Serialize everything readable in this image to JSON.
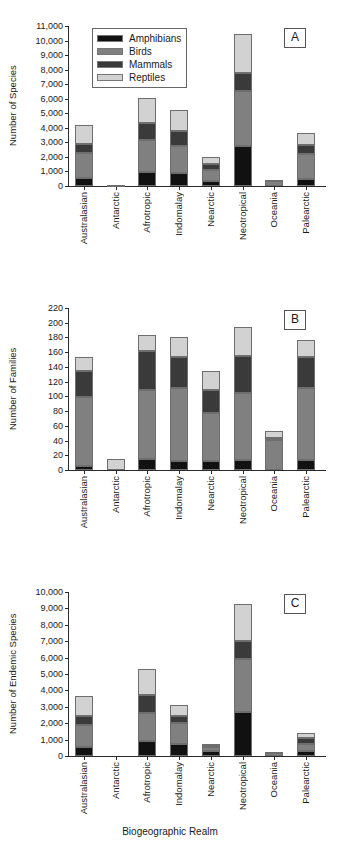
{
  "figure": {
    "xlabel": "Biogeographic Realm",
    "realms": [
      "Australasian",
      "Antarctic",
      "Afrotropic",
      "Indomalay",
      "Nearctic",
      "Neotropical",
      "Oceania",
      "Palearctic"
    ],
    "legend": {
      "position": "upper-left-panel-a",
      "entries": [
        {
          "label": "Amphibians",
          "color": "#111111"
        },
        {
          "label": "Birds",
          "color": "#808080"
        },
        {
          "label": "Mammals",
          "color": "#3a3a3a"
        },
        {
          "label": "Reptiles",
          "color": "#d2d2d2"
        }
      ]
    }
  },
  "chart_data": [
    {
      "id": "A",
      "type": "bar",
      "stacked": true,
      "panel_label": "A",
      "title": "",
      "xlabel": "",
      "ylabel": "Number of Species",
      "ylim": [
        0,
        11000
      ],
      "ytick_step": 1000,
      "yticks": [
        0,
        1000,
        2000,
        3000,
        4000,
        5000,
        6000,
        7000,
        8000,
        9000,
        10000,
        11000
      ],
      "ytick_labels": [
        "0",
        "1,000",
        "2,000",
        "3,000",
        "4,000",
        "5,000",
        "6,000",
        "7,000",
        "8,000",
        "9,000",
        "10,000",
        "11,000"
      ],
      "grid": false,
      "categories": [
        "Australasian",
        "Antarctic",
        "Afrotropic",
        "Indomalay",
        "Nearctic",
        "Neotropical",
        "Oceania",
        "Palearctic"
      ],
      "series": [
        {
          "name": "Amphibians",
          "color": "#111111",
          "values": [
            550,
            0,
            950,
            880,
            320,
            2740,
            0,
            460
          ]
        },
        {
          "name": "Birds",
          "color": "#808080",
          "values": [
            1700,
            0,
            2200,
            1900,
            770,
            3760,
            390,
            1750
          ]
        },
        {
          "name": "Mammals",
          "color": "#3a3a3a",
          "values": [
            650,
            0,
            1150,
            1000,
            450,
            1300,
            0,
            620
          ]
        },
        {
          "name": "Reptiles",
          "color": "#d2d2d2",
          "values": [
            1300,
            60,
            1750,
            1470,
            420,
            2620,
            20,
            830
          ]
        }
      ],
      "totals": [
        4200,
        60,
        6050,
        5250,
        1960,
        10420,
        410,
        3660
      ]
    },
    {
      "id": "B",
      "type": "bar",
      "stacked": true,
      "panel_label": "B",
      "title": "",
      "xlabel": "",
      "ylabel": "Number of Families",
      "ylim": [
        0,
        220
      ],
      "ytick_step": 20,
      "yticks": [
        0,
        20,
        40,
        60,
        80,
        100,
        120,
        140,
        160,
        180,
        200,
        220
      ],
      "ytick_labels": [
        "0",
        "20",
        "40",
        "60",
        "80",
        "100",
        "120",
        "140",
        "160",
        "180",
        "200",
        "220"
      ],
      "grid": false,
      "categories": [
        "Australasian",
        "Antarctic",
        "Afrotropic",
        "Indomalay",
        "Nearctic",
        "Neotropical",
        "Oceania",
        "Palearctic"
      ],
      "series": [
        {
          "name": "Amphibians",
          "color": "#111111",
          "values": [
            6,
            0,
            15,
            12,
            12,
            13,
            0,
            14
          ]
        },
        {
          "name": "Birds",
          "color": "#808080",
          "values": [
            93,
            0,
            94,
            99,
            66,
            92,
            41,
            97
          ]
        },
        {
          "name": "Mammals",
          "color": "#3a3a3a",
          "values": [
            35,
            0,
            52,
            43,
            30,
            50,
            3,
            43
          ]
        },
        {
          "name": "Reptiles",
          "color": "#d2d2d2",
          "values": [
            20,
            15,
            22,
            27,
            27,
            39,
            9,
            22
          ]
        }
      ],
      "totals": [
        154,
        15,
        183,
        181,
        135,
        194,
        53,
        176
      ]
    },
    {
      "id": "C",
      "type": "bar",
      "stacked": true,
      "panel_label": "C",
      "title": "",
      "xlabel": "Biogeographic Realm",
      "ylabel": "Number of Endemic Species",
      "ylim": [
        0,
        10000
      ],
      "ytick_step": 1000,
      "yticks": [
        0,
        1000,
        2000,
        3000,
        4000,
        5000,
        6000,
        7000,
        8000,
        9000,
        10000
      ],
      "ytick_labels": [
        "0",
        "1,000",
        "2,000",
        "3,000",
        "4,000",
        "5,000",
        "6,000",
        "7,000",
        "8,000",
        "9,000",
        "10,000"
      ],
      "grid": false,
      "categories": [
        "Australasian",
        "Antarctic",
        "Afrotropic",
        "Indomalay",
        "Nearctic",
        "Neotropical",
        "Oceania",
        "Palearctic"
      ],
      "series": [
        {
          "name": "Amphibians",
          "color": "#111111",
          "values": [
            540,
            0,
            920,
            760,
            300,
            2660,
            0,
            330
          ]
        },
        {
          "name": "Birds",
          "color": "#808080",
          "values": [
            1340,
            0,
            1730,
            1260,
            250,
            3240,
            210,
            400
          ]
        },
        {
          "name": "Mammals",
          "color": "#3a3a3a",
          "values": [
            560,
            0,
            1060,
            390,
            90,
            1100,
            30,
            340
          ]
        },
        {
          "name": "Reptiles",
          "color": "#d2d2d2",
          "values": [
            1240,
            0,
            1580,
            730,
            100,
            2240,
            10,
            330
          ]
        }
      ],
      "totals": [
        3680,
        0,
        5290,
        3140,
        740,
        9240,
        250,
        1400
      ]
    }
  ]
}
